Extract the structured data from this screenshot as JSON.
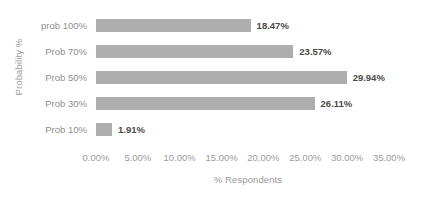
{
  "chart_data": {
    "type": "bar",
    "orientation": "horizontal",
    "title": "",
    "xlabel": "% Respondents",
    "ylabel": "Probability %",
    "categories": [
      "prob 100%",
      "Prob 70%",
      "Prob 50%",
      "Prob 30%",
      "Prob 10%"
    ],
    "values": [
      18.47,
      23.57,
      29.94,
      26.11,
      1.91
    ],
    "data_labels": [
      "18.47%",
      "23.57%",
      "29.94%",
      "26.11%",
      "1.91%"
    ],
    "xlim": [
      0,
      35
    ],
    "xticks": [
      0,
      5,
      10,
      15,
      20,
      25,
      30,
      35
    ],
    "xtick_labels": [
      "0.00%",
      "5.00%",
      "10.00%",
      "15.00%",
      "20.00%",
      "25.00%",
      "30.00%",
      "35.00%"
    ],
    "grid": false,
    "legend": false,
    "bar_color": "#aeaeae",
    "axis_text_color": "#9b9b9b",
    "label_text_color": "#4a4a4a",
    "background_color": "#ffffff"
  }
}
